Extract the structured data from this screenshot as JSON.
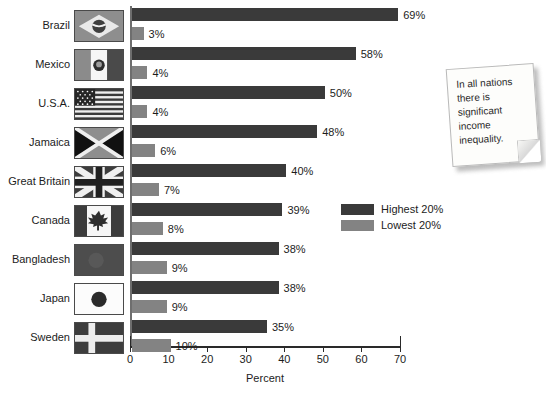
{
  "chart_data": {
    "type": "bar",
    "title": "",
    "xlabel": "Percent",
    "ylabel": "",
    "orientation": "horizontal",
    "xlim": [
      0,
      70
    ],
    "xticks": [
      0,
      10,
      20,
      30,
      40,
      50,
      60,
      70
    ],
    "grid": false,
    "legend_position": "center-right",
    "categories": [
      "Brazil",
      "Mexico",
      "U.S.A.",
      "Jamaica",
      "Great Britain",
      "Canada",
      "Bangladesh",
      "Japan",
      "Sweden"
    ],
    "series": [
      {
        "name": "Highest 20%",
        "color": "#3a3a3a",
        "values": [
          69,
          58,
          50,
          48,
          40,
          39,
          38,
          38,
          35
        ],
        "labels": [
          "69%",
          "58%",
          "50%",
          "48%",
          "40%",
          "39%",
          "38%",
          "38%",
          "35%"
        ]
      },
      {
        "name": "Lowest 20%",
        "color": "#838383",
        "values": [
          3,
          4,
          4,
          6,
          7,
          8,
          9,
          9,
          10
        ],
        "labels": [
          "3%",
          "4%",
          "4%",
          "6%",
          "7%",
          "8%",
          "9%",
          "9%",
          "10%"
        ]
      }
    ],
    "annotations": [
      "In all nations there is significant income inequality."
    ]
  },
  "axis": {
    "x_title": "Percent",
    "ticks": [
      "0",
      "10",
      "20",
      "30",
      "40",
      "50",
      "60",
      "70"
    ]
  },
  "rows": [
    {
      "country": "Brazil",
      "flag": "flag-brazil",
      "high_label": "69%",
      "low_label": "3%"
    },
    {
      "country": "Mexico",
      "flag": "flag-mexico",
      "high_label": "58%",
      "low_label": "4%"
    },
    {
      "country": "U.S.A.",
      "flag": "flag-usa",
      "high_label": "50%",
      "low_label": "4%"
    },
    {
      "country": "Jamaica",
      "flag": "flag-jamaica",
      "high_label": "48%",
      "low_label": "6%"
    },
    {
      "country": "Great Britain",
      "flag": "flag-great-britain",
      "high_label": "40%",
      "low_label": "7%"
    },
    {
      "country": "Canada",
      "flag": "flag-canada",
      "high_label": "39%",
      "low_label": "8%"
    },
    {
      "country": "Bangladesh",
      "flag": "flag-bangladesh",
      "high_label": "38%",
      "low_label": "9%"
    },
    {
      "country": "Japan",
      "flag": "flag-japan",
      "high_label": "38%",
      "low_label": "9%"
    },
    {
      "country": "Sweden",
      "flag": "flag-sweden",
      "high_label": "35%",
      "low_label": "10%"
    }
  ],
  "legend": {
    "items": [
      {
        "label": "Highest 20%",
        "color": "#3a3a3a"
      },
      {
        "label": "Lowest 20%",
        "color": "#838383"
      }
    ]
  },
  "note": {
    "text": "In all nations there is significant income inequality."
  },
  "colors": {
    "highest": "#3a3a3a",
    "lowest": "#838383",
    "axis": "#2a2a2a",
    "text": "#1c1c1c"
  }
}
